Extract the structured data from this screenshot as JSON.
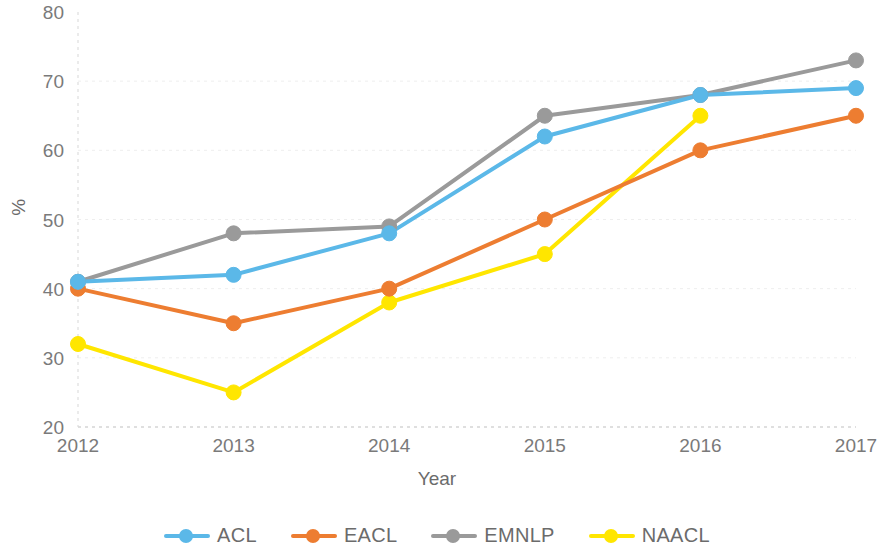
{
  "chart_data": {
    "type": "line",
    "title": "",
    "xlabel": "Year",
    "ylabel": "%",
    "categories": [
      "2012",
      "2013",
      "2014",
      "2015",
      "2016",
      "2017"
    ],
    "x": [
      2012,
      2013,
      2014,
      2015,
      2016,
      2017
    ],
    "xlim": [
      2012,
      2017
    ],
    "ylim": [
      20,
      80
    ],
    "yticks": [
      20,
      30,
      40,
      50,
      60,
      70,
      80
    ],
    "grid": true,
    "legend_position": "bottom",
    "series": [
      {
        "name": "ACL",
        "color": "#5BB8E8",
        "values": [
          41,
          42,
          48,
          62,
          68,
          69
        ]
      },
      {
        "name": "EACL",
        "color": "#ED7D31",
        "values": [
          40,
          35,
          40,
          50,
          60,
          65
        ]
      },
      {
        "name": "EMNLP",
        "color": "#9A9A9A",
        "values": [
          41,
          48,
          49,
          65,
          68,
          73
        ]
      },
      {
        "name": "NAACL",
        "color": "#FFE600",
        "values": [
          32,
          25,
          38,
          45,
          65,
          null
        ]
      }
    ]
  },
  "axes": {
    "y_title": "%",
    "x_title": "Year",
    "y_tick_labels": [
      "80",
      "70",
      "60",
      "50",
      "40",
      "30",
      "20"
    ],
    "x_tick_labels": [
      "2012",
      "2013",
      "2014",
      "2015",
      "2016",
      "2017"
    ]
  },
  "legend": {
    "items": [
      {
        "label": "ACL",
        "color": "#5BB8E8"
      },
      {
        "label": "EACL",
        "color": "#ED7D31"
      },
      {
        "label": "EMNLP",
        "color": "#9A9A9A"
      },
      {
        "label": "NAACL",
        "color": "#FFE600"
      }
    ]
  }
}
